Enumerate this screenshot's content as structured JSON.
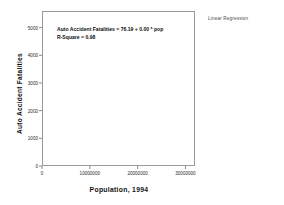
{
  "legend": {
    "label": "Linear Regression"
  },
  "chart_data": {
    "type": "scatter",
    "title": "",
    "xlabel": "Population, 1994",
    "ylabel": "Auto Accident Fatalities",
    "xlim": [
      0,
      32000000
    ],
    "ylim": [
      0,
      5600
    ],
    "grid": false,
    "legend_position": "top-right",
    "annotations": [
      "Auto Accident Fatalities = 76.19 + 0.00 * pop",
      "R-Square = 0.98"
    ],
    "regression": {
      "intercept": 76.19,
      "slope": 0.00017,
      "r_square": 0.98,
      "line_x": [
        0,
        31000000
      ],
      "line_y": [
        76,
        5346
      ]
    },
    "xticks": [
      0,
      10000000,
      20000000,
      30000000
    ],
    "xtick_labels": [
      "0",
      "10000000",
      "20000000",
      "30000000"
    ],
    "yticks": [
      0,
      1000,
      2000,
      3000,
      4000,
      5000
    ],
    "ytick_labels": [
      "0",
      "1000",
      "2000",
      "3000",
      "4000",
      "5000"
    ],
    "marker": "open-circle",
    "series": [
      {
        "name": "States",
        "points": [
          [
            31000000,
            5250
          ],
          [
            18000000,
            3200
          ],
          [
            17500000,
            2250
          ],
          [
            14500000,
            2870
          ],
          [
            12000000,
            1650
          ],
          [
            11800000,
            1620
          ],
          [
            11500000,
            1600
          ],
          [
            9000000,
            1550
          ],
          [
            8800000,
            1520
          ],
          [
            7200000,
            1570
          ],
          [
            7000000,
            1310
          ],
          [
            6900000,
            1230
          ],
          [
            6600000,
            1180
          ],
          [
            6400000,
            1150
          ],
          [
            6200000,
            990
          ],
          [
            6000000,
            880
          ],
          [
            5900000,
            1080
          ],
          [
            5600000,
            620
          ],
          [
            5500000,
            1020
          ],
          [
            5400000,
            960
          ],
          [
            5200000,
            930
          ],
          [
            5000000,
            900
          ],
          [
            4900000,
            870
          ],
          [
            4800000,
            820
          ],
          [
            4600000,
            790
          ],
          [
            4500000,
            1000
          ],
          [
            4400000,
            760
          ],
          [
            4300000,
            740
          ],
          [
            4200000,
            700
          ],
          [
            4000000,
            680
          ],
          [
            3800000,
            620
          ],
          [
            3700000,
            560
          ],
          [
            3600000,
            540
          ],
          [
            3500000,
            760
          ],
          [
            3400000,
            500
          ],
          [
            3300000,
            480
          ],
          [
            3200000,
            470
          ],
          [
            3100000,
            450
          ],
          [
            3000000,
            430
          ],
          [
            2900000,
            420
          ],
          [
            2800000,
            400
          ],
          [
            2700000,
            390
          ],
          [
            2600000,
            380
          ],
          [
            2500000,
            360
          ],
          [
            2400000,
            350
          ],
          [
            2300000,
            340
          ],
          [
            2200000,
            330
          ],
          [
            2100000,
            320
          ],
          [
            2000000,
            300
          ],
          [
            1900000,
            290
          ],
          [
            1800000,
            280
          ],
          [
            1700000,
            260
          ],
          [
            1600000,
            250
          ],
          [
            1500000,
            240
          ],
          [
            1400000,
            230
          ],
          [
            1300000,
            220
          ],
          [
            1200000,
            210
          ],
          [
            1100000,
            195
          ],
          [
            1000000,
            185
          ],
          [
            950000,
            175
          ],
          [
            900000,
            165
          ],
          [
            820000,
            155
          ],
          [
            750000,
            145
          ],
          [
            700000,
            140
          ],
          [
            650000,
            130
          ],
          [
            600000,
            125
          ],
          [
            580000,
            120
          ],
          [
            550000,
            118
          ],
          [
            520000,
            112
          ],
          [
            480000,
            105
          ],
          [
            5600000,
            140
          ]
        ]
      }
    ]
  }
}
